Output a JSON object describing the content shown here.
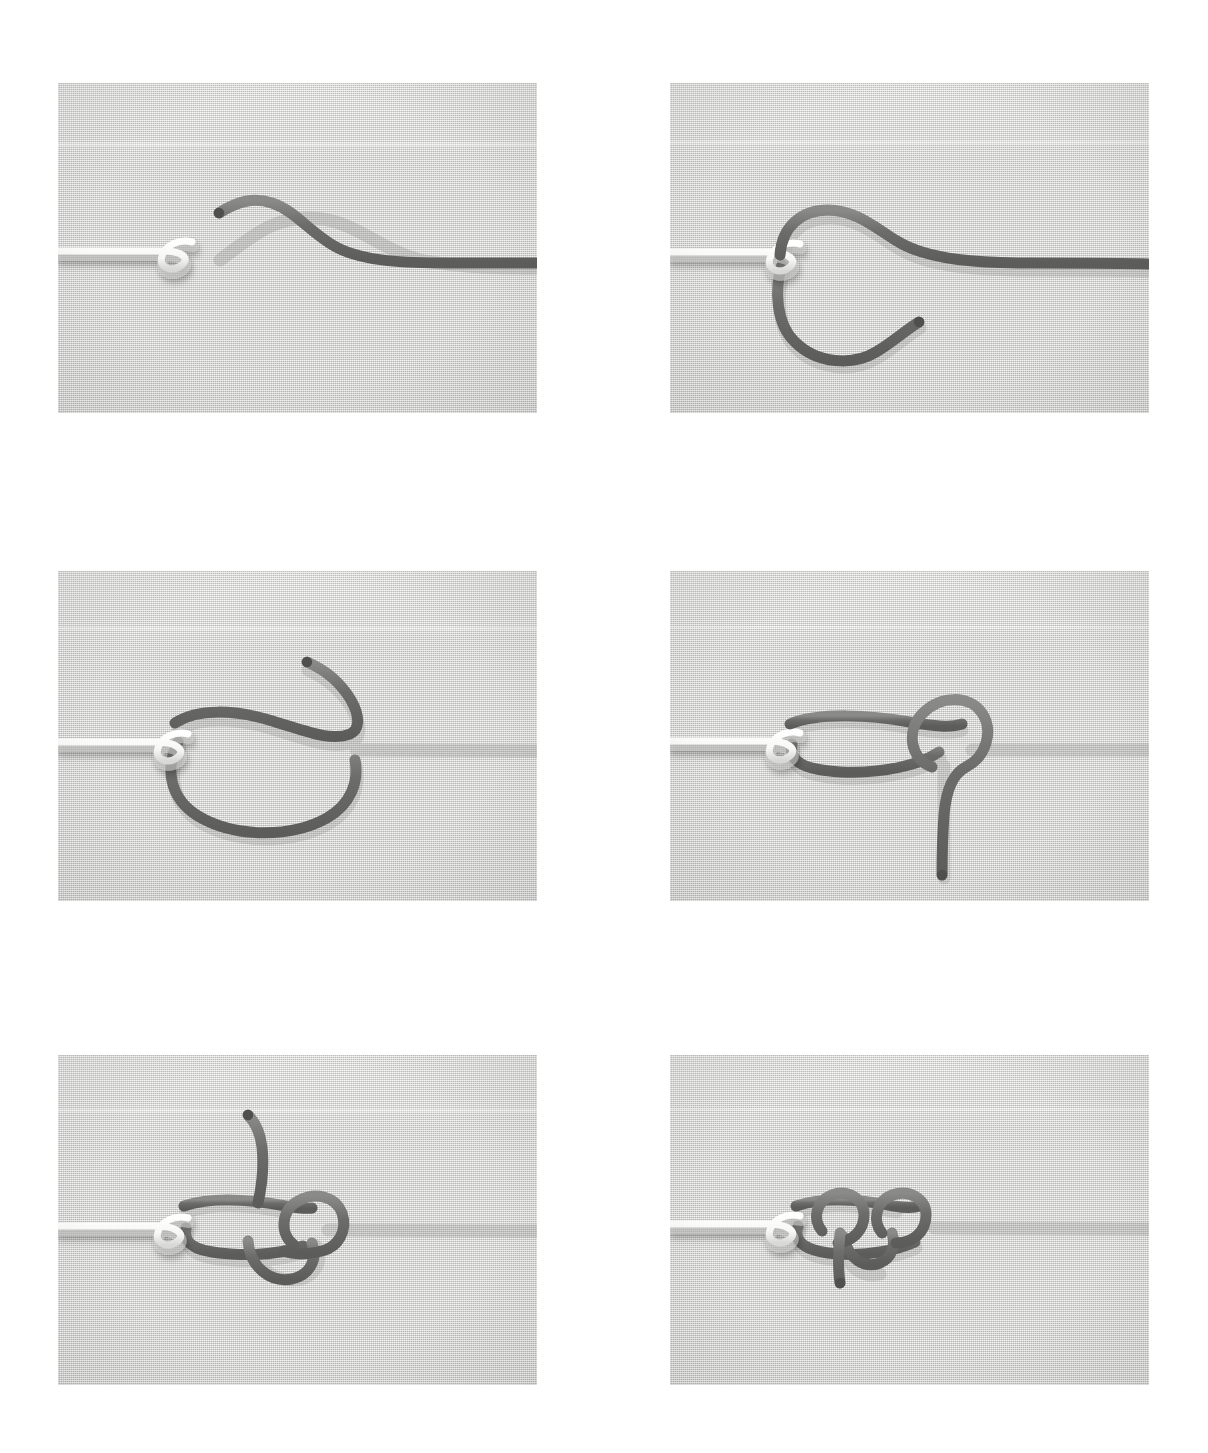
{
  "figure": {
    "kind": "photo-sequence",
    "panel_count": 6,
    "columns": 2,
    "rows": 3,
    "page_background": "#ffffff",
    "panel_background": "#d3d3d1",
    "dark_cord_color": "#6d6d6b",
    "dark_cord_shadow": "#a9a9a7",
    "white_cord_color": "#fbfbfa",
    "white_cord_shadow": "#bdbdbb",
    "cord_width_px": 11,
    "white_cord_width_px": 7
  },
  "panels": [
    {
      "index": 1,
      "step_label": "1",
      "alt": "White cord with small closed eye loop at left; dark cord end lies free above and to the right, running off the right edge",
      "x": 58,
      "y": 83,
      "w": 479,
      "h": 330,
      "white_cord": "straight from left edge, small overhand eye loop near x=175",
      "dark_cord": "free tip near x=218,y=210 curving up then sweeping down to a horizontal run off the right edge",
      "dark_tip": {
        "x": 218,
        "y": 212
      }
    },
    {
      "index": 2,
      "step_label": "2",
      "alt": "Dark cord passed through the white eye loop and brought back down forming an open circle below the line, tip pointing right",
      "x": 670,
      "y": 83,
      "w": 479,
      "h": 330,
      "white_cord": "straight from left edge, eye loop at x=788",
      "dark_cord": "enters the eye, arcs over the top then loops clockwise down and around forming an open ring; tip points right-ish",
      "dark_tip": {
        "x": 918,
        "y": 316
      }
    },
    {
      "index": 3,
      "step_label": "3",
      "alt": "Dark cord drawn into a long flattened loop through the eye, working end arcs up and over to the right with tip pointing up-left",
      "x": 58,
      "y": 571,
      "w": 479,
      "h": 330,
      "white_cord": "straight from left edge, eye loop at x=180",
      "dark_cord": "long teardrop loop through the eye; standing part exits right; working end curls up with tip at upper middle",
      "dark_tip": {
        "x": 328,
        "y": 653
      }
    },
    {
      "index": 4,
      "step_label": "4",
      "alt": "Working end wrapped once around the standing line forming a small round loop at the right of the flattened loop; tail hangs down",
      "x": 670,
      "y": 571,
      "w": 479,
      "h": 330,
      "white_cord": "straight from left edge, eye loop at x=790",
      "dark_cord": "flattened ellipse through the eye, one turn made around the standing part at x≈950; tail hangs straight down",
      "dark_tip": {
        "x": 937,
        "y": 882
      }
    },
    {
      "index": 5,
      "step_label": "5",
      "alt": "Working end passed a second time through the loop creating two stacked turns; tail now rises upward from the knot",
      "x": 58,
      "y": 1055,
      "w": 479,
      "h": 330,
      "white_cord": "straight from left edge, eye loop at x=175",
      "dark_cord": "two wraps formed inside the flattened loop; tail exits upward from the middle of the knot",
      "dark_tip": {
        "x": 231,
        "y": 1115
      }
    },
    {
      "index": 6,
      "step_label": "6",
      "alt": "Knot snugged down into two neat side-by-side coils against the white eye; short tail points down-left",
      "x": 670,
      "y": 1055,
      "w": 479,
      "h": 330,
      "white_cord": "straight from left edge, eye loop at x=790",
      "dark_cord": "knot drawn tight into two adjacent coils; standing part exits right; short tail points down",
      "dark_tip": {
        "x": 848,
        "y": 1265
      }
    }
  ]
}
